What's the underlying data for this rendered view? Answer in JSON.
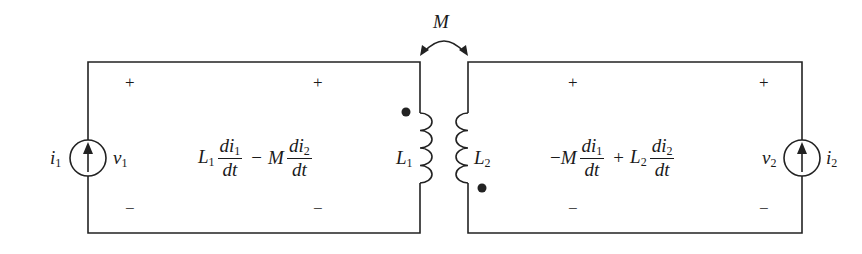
{
  "diagram": {
    "type": "coupled-inductor circuit",
    "mutual": {
      "label": "M"
    },
    "left_source": {
      "current": "i",
      "current_sub": "1",
      "voltage": "v",
      "voltage_sub": "1"
    },
    "right_source": {
      "current": "i",
      "current_sub": "2",
      "voltage": "v",
      "voltage_sub": "2"
    },
    "inductor1": {
      "label": "L",
      "sub": "1"
    },
    "inductor2": {
      "label": "L",
      "sub": "2"
    },
    "signs": {
      "plus": "+",
      "minus": "−"
    },
    "left_equation": {
      "t1_coef": "L",
      "t1_coef_sub": "1",
      "t1_num": "di",
      "t1_num_sub": "1",
      "t1_den": "dt",
      "op": "−",
      "t2_coef": "M",
      "t2_num": "di",
      "t2_num_sub": "2",
      "t2_den": "dt"
    },
    "right_equation": {
      "t1_prefix": "−",
      "t1_coef": "M",
      "t1_num": "di",
      "t1_num_sub": "1",
      "t1_den": "dt",
      "op": "+",
      "t2_coef": "L",
      "t2_coef_sub": "2",
      "t2_num": "di",
      "t2_num_sub": "2",
      "t2_den": "dt"
    }
  }
}
